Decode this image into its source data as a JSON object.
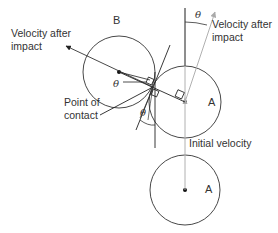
{
  "labels": {
    "ball_b": "B",
    "ball_a_after": "A",
    "ball_a_initial": "A",
    "velocity_after_b_line1": "Velocity after",
    "velocity_after_b_line2": "impact",
    "velocity_after_a_line1": "Velocity after",
    "velocity_after_a_line2": "impact",
    "point_of_contact_line1": "Point of",
    "point_of_contact_line2": "contact",
    "initial_velocity": "Initial velocity",
    "theta_b": "θ",
    "theta_a_top": "θ",
    "theta_bottom": "θ"
  },
  "colors": {
    "line": "#222222",
    "velocity_line": "#b0b0b0",
    "text": "#333333"
  }
}
